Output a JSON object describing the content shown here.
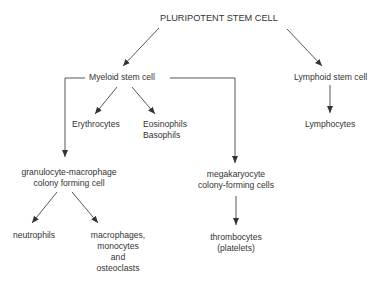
{
  "diagram": {
    "type": "hierarchy",
    "root": "PLURIPOTENT STEM CELL",
    "nodes": {
      "root": {
        "label": "PLURIPOTENT STEM CELL"
      },
      "myeloid": {
        "label": "Myeloid stem cell"
      },
      "lymphoid": {
        "label": "Lymphoid stem cell"
      },
      "erythrocytes": {
        "label": "Erythrocytes"
      },
      "eos_baso": {
        "line1": "Eosinophils",
        "line2": "Basophils"
      },
      "gm_cfc": {
        "line1": "granulocyte-macrophage",
        "line2": "colony forming cell"
      },
      "mk_cfc": {
        "line1": "megakaryocyte",
        "line2": "colony-forming cells"
      },
      "lymphocytes": {
        "label": "Lymphocytes"
      },
      "neutrophils": {
        "label": "neutrophils"
      },
      "macrophages": {
        "line1": "macrophages,",
        "line2": "monocytes",
        "line3": "and",
        "line4": "osteoclasts"
      },
      "thrombocytes": {
        "line1": "thrombocytes",
        "line2": "(platelets)"
      }
    },
    "edges": [
      [
        "root",
        "myeloid"
      ],
      [
        "root",
        "lymphoid"
      ],
      [
        "myeloid",
        "erythrocytes"
      ],
      [
        "myeloid",
        "eos_baso"
      ],
      [
        "myeloid",
        "gm_cfc"
      ],
      [
        "myeloid",
        "mk_cfc"
      ],
      [
        "lymphoid",
        "lymphocytes"
      ],
      [
        "gm_cfc",
        "neutrophils"
      ],
      [
        "gm_cfc",
        "macrophages"
      ],
      [
        "mk_cfc",
        "thrombocytes"
      ]
    ],
    "colors": {
      "line": "#333333",
      "text": "#333333",
      "background": "#ffffff"
    }
  }
}
